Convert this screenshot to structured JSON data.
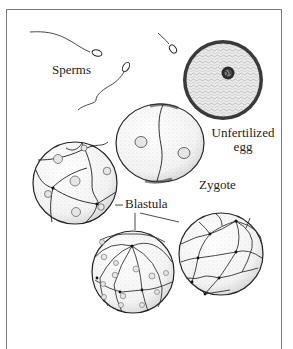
{
  "figure": {
    "labels": {
      "sperms": "Sperms",
      "unfertilized_egg_line1": "Unfertilized",
      "unfertilized_egg_line2": "egg",
      "zygote": "Zygote",
      "blastula": "Blastula"
    },
    "elements": [
      {
        "id": "sperm",
        "count": 3
      },
      {
        "id": "unfertilized-egg",
        "count": 1
      },
      {
        "id": "zygote-two-cell",
        "count": 1
      },
      {
        "id": "embryo-eight-cell",
        "count": 1
      },
      {
        "id": "blastula-sphere",
        "count": 2
      }
    ],
    "colors": {
      "ink": "#222222",
      "frame": "#7a7a7a",
      "stipple": "#9a9a9a",
      "background": "#ffffff"
    }
  }
}
